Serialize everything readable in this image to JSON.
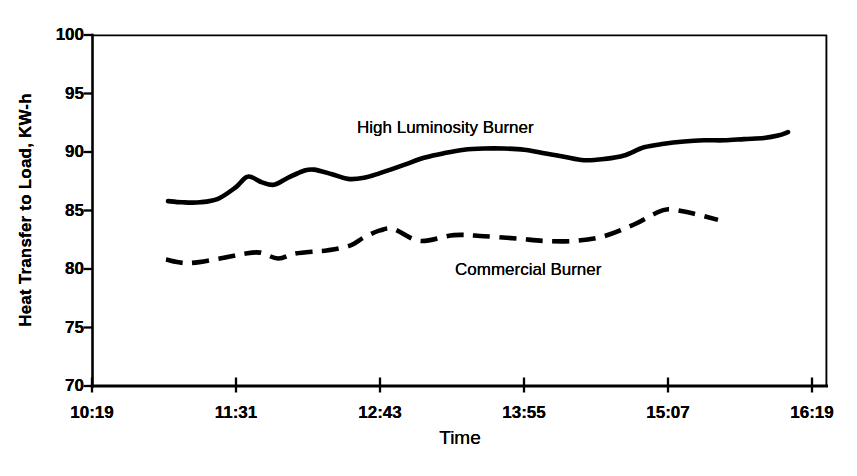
{
  "chart_data": {
    "type": "line",
    "title": "",
    "xlabel": "Time",
    "ylabel": "Heat Transfer to Load, KW-h",
    "x_ticks": [
      "10:19",
      "11:31",
      "12:43",
      "13:55",
      "15:07",
      "16:19"
    ],
    "y_ticks": [
      100,
      95,
      90,
      85,
      80,
      75,
      70
    ],
    "ylim": [
      70,
      100
    ],
    "grid": "off",
    "legend": "inline-annotations",
    "line_color": "#000000",
    "series": [
      {
        "name": "High Luminosity Burner",
        "line_style": "solid",
        "color": "#000000",
        "points": [
          [
            "10:57",
            85.8
          ],
          [
            "11:04",
            85.7
          ],
          [
            "11:13",
            85.7
          ],
          [
            "11:22",
            86.0
          ],
          [
            "11:31",
            87.0
          ],
          [
            "11:37",
            87.9
          ],
          [
            "11:44",
            87.4
          ],
          [
            "11:50",
            87.2
          ],
          [
            "11:57",
            87.8
          ],
          [
            "12:05",
            88.4
          ],
          [
            "12:10",
            88.5
          ],
          [
            "12:19",
            88.1
          ],
          [
            "12:27",
            87.7
          ],
          [
            "12:35",
            87.8
          ],
          [
            "12:43",
            88.2
          ],
          [
            "12:55",
            88.9
          ],
          [
            "13:05",
            89.5
          ],
          [
            "13:15",
            89.9
          ],
          [
            "13:25",
            90.2
          ],
          [
            "13:35",
            90.3
          ],
          [
            "13:45",
            90.3
          ],
          [
            "13:55",
            90.2
          ],
          [
            "14:05",
            89.9
          ],
          [
            "14:15",
            89.6
          ],
          [
            "14:25",
            89.3
          ],
          [
            "14:35",
            89.4
          ],
          [
            "14:45",
            89.7
          ],
          [
            "14:55",
            90.4
          ],
          [
            "15:05",
            90.7
          ],
          [
            "15:15",
            90.9
          ],
          [
            "15:25",
            91.0
          ],
          [
            "15:35",
            91.0
          ],
          [
            "15:45",
            91.1
          ],
          [
            "15:55",
            91.2
          ],
          [
            "16:02",
            91.4
          ],
          [
            "16:07",
            91.7
          ]
        ]
      },
      {
        "name": "Commercial Burner",
        "line_style": "dashed",
        "color": "#000000",
        "points": [
          [
            "10:56",
            80.8
          ],
          [
            "11:07",
            80.5
          ],
          [
            "11:23",
            80.9
          ],
          [
            "11:35",
            81.3
          ],
          [
            "11:43",
            81.4
          ],
          [
            "11:52",
            80.9
          ],
          [
            "12:00",
            81.3
          ],
          [
            "12:10",
            81.5
          ],
          [
            "12:17",
            81.6
          ],
          [
            "12:28",
            82.0
          ],
          [
            "12:35",
            82.7
          ],
          [
            "12:43",
            83.3
          ],
          [
            "12:50",
            83.4
          ],
          [
            "13:03",
            82.4
          ],
          [
            "13:20",
            82.9
          ],
          [
            "13:35",
            82.8
          ],
          [
            "13:52",
            82.6
          ],
          [
            "14:05",
            82.4
          ],
          [
            "14:20",
            82.4
          ],
          [
            "14:35",
            82.8
          ],
          [
            "14:50",
            83.8
          ],
          [
            "15:00",
            84.7
          ],
          [
            "15:07",
            85.1
          ],
          [
            "15:18",
            84.8
          ],
          [
            "15:32",
            84.2
          ]
        ]
      }
    ]
  }
}
